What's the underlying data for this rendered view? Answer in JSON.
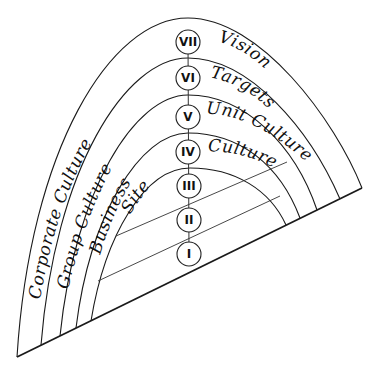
{
  "diagram": {
    "type": "nested-arch-culture-levels",
    "levels": [
      {
        "numeral": "VII",
        "label_left": "Corporate Culture",
        "label_right": "Vision"
      },
      {
        "numeral": "VI",
        "label_left": "Group Culture",
        "label_right": "Targets"
      },
      {
        "numeral": "V",
        "label_left": "Business",
        "label_right": "Unit Culture"
      },
      {
        "numeral": "IV",
        "label_left": "Site",
        "label_right": "Culture"
      },
      {
        "numeral": "III",
        "label_left": "",
        "label_right": ""
      },
      {
        "numeral": "II",
        "label_left": "",
        "label_right": ""
      },
      {
        "numeral": "I",
        "label_left": "",
        "label_right": ""
      }
    ]
  }
}
